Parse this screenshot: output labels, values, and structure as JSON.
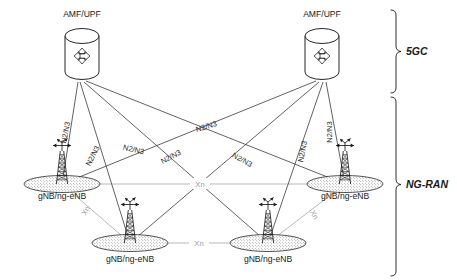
{
  "figure": {
    "background_color": "#ffffff"
  },
  "colors": {
    "line_n2n3": "#3a3a3a",
    "line_xn": "#b0b0b0",
    "text": "#1a1a1a",
    "text_xn": "#9a9a9a",
    "shape_stroke": "#1a1a1a",
    "shape_fill": "#ffffff"
  },
  "core_nodes": [
    {
      "id": "amf-upf-left",
      "label": "AMF/UPF",
      "icon": "cylinder-four-arrows-icon",
      "x": 82,
      "y": 55,
      "label_x": 82,
      "label_y": 17
    },
    {
      "id": "amf-upf-right",
      "label": "AMF/UPF",
      "icon": "cylinder-four-arrows-icon",
      "x": 322,
      "y": 55,
      "label_x": 322,
      "label_y": 17
    }
  ],
  "ran_nodes": [
    {
      "id": "gnb-left",
      "label": "gNB/ng-eNB",
      "icon": "cell-tower-icon",
      "x": 62,
      "y": 184,
      "label_x": 62,
      "label_y": 199
    },
    {
      "id": "gnb-right",
      "label": "gNB/ng-eNB",
      "icon": "cell-tower-icon",
      "x": 345,
      "y": 184,
      "label_x": 345,
      "label_y": 199
    },
    {
      "id": "gnb-bottom-left",
      "label": "gNB/ng-eNB",
      "icon": "cell-tower-icon",
      "x": 130,
      "y": 243,
      "label_x": 130,
      "label_y": 262
    },
    {
      "id": "gnb-bottom-right",
      "label": "gNB/ng-eNB",
      "icon": "cell-tower-icon",
      "x": 268,
      "y": 243,
      "label_x": 268,
      "label_y": 262
    }
  ],
  "links": {
    "n2n3_label": "N2/N3",
    "xn_label": "Xn",
    "n2n3": [
      {
        "from": "amf-upf-left",
        "to": "gnb-left",
        "label": "N2/N3",
        "label_x": 68,
        "label_y": 133,
        "rotate": -78
      },
      {
        "from": "amf-upf-left",
        "to": "gnb-bottom-left",
        "label": "N2/N3",
        "label_x": 93,
        "label_y": 155,
        "rotate": -62
      },
      {
        "from": "amf-upf-left",
        "to": "gnb-bottom-right",
        "label": "N2/N3",
        "label_x": 170,
        "label_y": 157,
        "rotate": -26
      },
      {
        "from": "amf-upf-left",
        "to": "gnb-right",
        "label": "N2/N3",
        "label_x": 207,
        "label_y": 129,
        "rotate": -16
      }
    ],
    "n2n3_right": [
      {
        "from": "amf-upf-right",
        "to": "gnb-right",
        "label": "N2/N3",
        "label_x": 330,
        "label_y": 133,
        "rotate": -90
      },
      {
        "from": "amf-upf-right",
        "to": "gnb-bottom-right",
        "label": "N2/N3",
        "label_x": 304,
        "label_y": 152,
        "rotate": -78
      },
      {
        "from": "amf-upf-right",
        "to": "gnb-bottom-left",
        "label": "N2/N3",
        "label_x": 240,
        "label_y": 161,
        "rotate": 28
      },
      {
        "from": "amf-upf-right",
        "to": "gnb-left",
        "label": "N2/N3",
        "label_x": 132,
        "label_y": 152,
        "rotate": 14
      }
    ],
    "xn": [
      {
        "from": "gnb-left",
        "to": "gnb-right",
        "label": "Xn",
        "label_x": 200,
        "label_y": 184,
        "rotate": 0
      },
      {
        "from": "gnb-bottom-left",
        "to": "gnb-bottom-right",
        "label": "Xn",
        "label_x": 199,
        "label_y": 243,
        "rotate": 0
      },
      {
        "from": "gnb-left",
        "to": "gnb-bottom-left",
        "label": "Xn",
        "label_x": 88,
        "label_y": 212,
        "rotate": -60
      },
      {
        "from": "gnb-right",
        "to": "gnb-bottom-right",
        "label": "Xn",
        "label_x": 312,
        "label_y": 215,
        "rotate": 62
      }
    ]
  },
  "groups": [
    {
      "id": "group-5gc",
      "label": "5GC",
      "label_x": 412,
      "label_y": 52,
      "brace_top": 10,
      "brace_bottom": 93
    },
    {
      "id": "group-ng-ran",
      "label": "NG-RAN",
      "label_x": 412,
      "label_y": 186,
      "brace_top": 97,
      "brace_bottom": 276
    }
  ]
}
